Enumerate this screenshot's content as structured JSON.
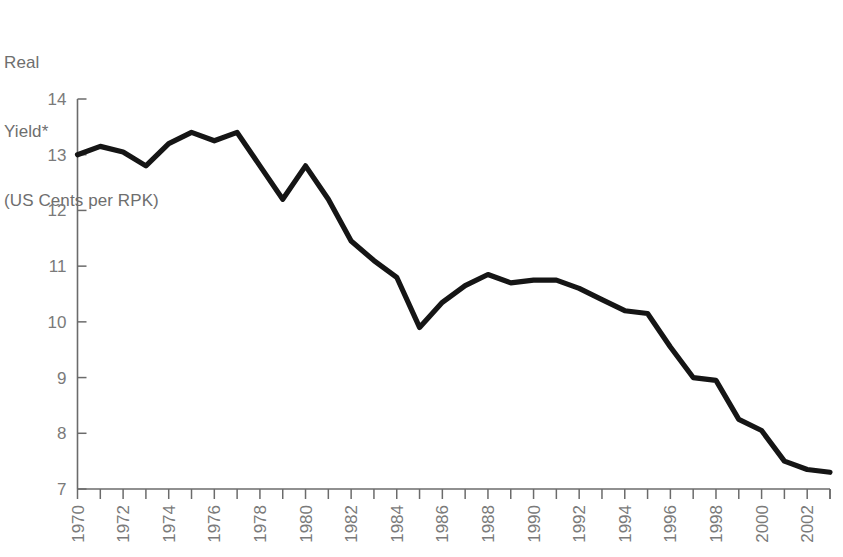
{
  "figure": {
    "axis_title_lines": [
      "Real",
      "Yield*",
      "(US Cents per RPK)"
    ],
    "axis_color": "#6b6b6b",
    "label_color": "#7a7a7a",
    "line_color": "#151515",
    "background": "#ffffff"
  },
  "chart_data": {
    "type": "line",
    "title": "Real Yield* (US Cents per RPK)",
    "xlabel": "",
    "ylabel": "Real Yield* (US Cents per RPK)",
    "ylim": [
      7,
      14
    ],
    "xlim": [
      1970,
      2003
    ],
    "grid": false,
    "legend": null,
    "y_ticks": [
      7,
      8,
      9,
      10,
      11,
      12,
      13,
      14
    ],
    "y_tick_labels": [
      "7",
      "8",
      "9",
      "10",
      "11",
      "12",
      "13",
      "14"
    ],
    "x_ticks": [
      1970,
      1971,
      1972,
      1973,
      1974,
      1975,
      1976,
      1977,
      1978,
      1979,
      1980,
      1981,
      1982,
      1983,
      1984,
      1985,
      1986,
      1987,
      1988,
      1989,
      1990,
      1991,
      1992,
      1993,
      1994,
      1995,
      1996,
      1997,
      1998,
      1999,
      2000,
      2001,
      2002,
      2003
    ],
    "x_tick_labels": [
      "1970",
      "",
      "1972",
      "",
      "1974",
      "",
      "1976",
      "",
      "1978",
      "",
      "1980",
      "",
      "1982",
      "",
      "1984",
      "",
      "1986",
      "",
      "1988",
      "",
      "1990",
      "",
      "1992",
      "",
      "1994",
      "",
      "1996",
      "",
      "1998",
      "",
      "2000",
      "",
      "2002",
      ""
    ],
    "x": [
      1970,
      1971,
      1972,
      1973,
      1974,
      1975,
      1976,
      1977,
      1978,
      1979,
      1980,
      1981,
      1982,
      1983,
      1984,
      1985,
      1986,
      1987,
      1988,
      1989,
      1990,
      1991,
      1992,
      1993,
      1994,
      1995,
      1996,
      1997,
      1998,
      1999,
      2000,
      2001,
      2002,
      2003
    ],
    "values": [
      13.0,
      13.15,
      13.05,
      12.8,
      13.2,
      13.4,
      13.25,
      13.4,
      12.8,
      12.2,
      12.8,
      12.2,
      11.45,
      11.1,
      10.8,
      9.9,
      10.35,
      10.65,
      10.85,
      10.7,
      10.75,
      10.75,
      10.6,
      10.4,
      10.2,
      10.15,
      9.55,
      9.0,
      8.95,
      8.25,
      8.05,
      7.5,
      7.35,
      7.3
    ],
    "series": [
      {
        "name": "Real Yield",
        "values": [
          13.0,
          13.15,
          13.05,
          12.8,
          13.2,
          13.4,
          13.25,
          13.4,
          12.8,
          12.2,
          12.8,
          12.2,
          11.45,
          11.1,
          10.8,
          9.9,
          10.35,
          10.65,
          10.85,
          10.7,
          10.75,
          10.75,
          10.6,
          10.4,
          10.2,
          10.15,
          9.55,
          9.0,
          8.95,
          8.25,
          8.05,
          7.5,
          7.35,
          7.3
        ]
      }
    ]
  }
}
